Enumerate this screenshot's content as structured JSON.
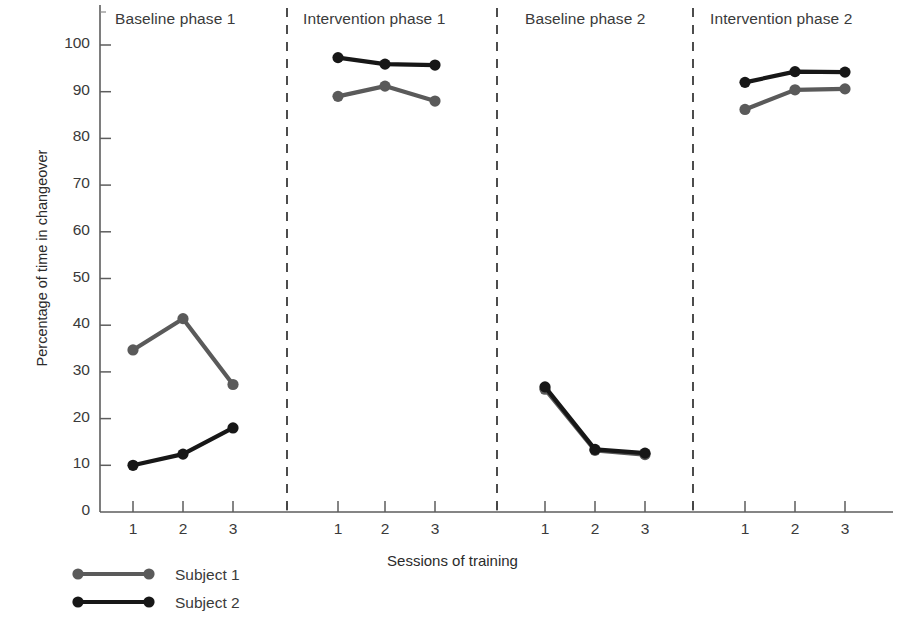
{
  "chart_data": {
    "type": "line",
    "title": "",
    "xlabel": "Sessions of training",
    "ylabel": "Percentage of time in changeover",
    "ylim": [
      0,
      100
    ],
    "yticks": [
      0,
      10,
      20,
      30,
      40,
      50,
      60,
      70,
      80,
      90,
      100
    ],
    "grid": false,
    "legend_position": "bottom-left",
    "phases": [
      {
        "name": "Baseline phase 1",
        "sessions": [
          "1",
          "2",
          "3"
        ]
      },
      {
        "name": "Intervention phase 1",
        "sessions": [
          "1",
          "2",
          "3"
        ]
      },
      {
        "name": "Baseline phase 2",
        "sessions": [
          "1",
          "2",
          "3"
        ]
      },
      {
        "name": "Intervention phase 2",
        "sessions": [
          "1",
          "2",
          "3"
        ]
      }
    ],
    "series": [
      {
        "name": "Subject 1",
        "color": "#5a5a5a",
        "values_by_phase": [
          [
            34.7,
            41.4,
            27.3
          ],
          [
            89.0,
            91.2,
            88.0
          ],
          [
            26.3,
            13.2,
            12.3
          ],
          [
            86.2,
            90.4,
            90.6
          ]
        ]
      },
      {
        "name": "Subject 2",
        "color": "#171717",
        "values_by_phase": [
          [
            10.0,
            12.4,
            18.0
          ],
          [
            97.3,
            95.9,
            95.7
          ],
          [
            26.8,
            13.4,
            12.6
          ],
          [
            92.0,
            94.3,
            94.2
          ]
        ]
      }
    ]
  },
  "legend": {
    "entries": [
      {
        "label": "Subject 1",
        "color": "#5a5a5a"
      },
      {
        "label": "Subject 2",
        "color": "#171717"
      }
    ]
  },
  "axes": {
    "y_axis_title": "Percentage of time in changeover",
    "x_axis_title": "Sessions of training"
  }
}
